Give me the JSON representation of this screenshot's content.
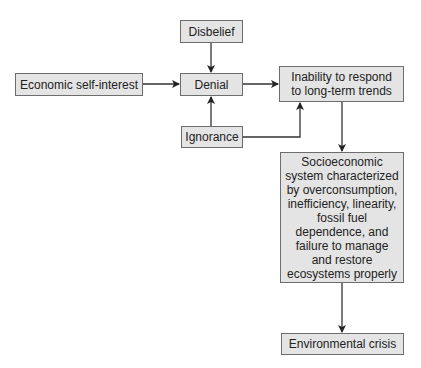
{
  "nodes": {
    "disbelief": "Disbelief",
    "economic": "Economic self-interest",
    "denial": "Denial",
    "ignorance": "Ignorance",
    "inability": "Inability to respond to long-term trends",
    "socioeconomic": "Socioeconomic system characterized by overconsumption, inefficiency, linearity, fossil fuel dependence, and failure to manage and restore ecosystems properly",
    "crisis": "Environmental crisis"
  },
  "edges": [
    {
      "from": "disbelief",
      "to": "denial"
    },
    {
      "from": "economic",
      "to": "denial"
    },
    {
      "from": "ignorance",
      "to": "denial"
    },
    {
      "from": "ignorance",
      "to": "inability"
    },
    {
      "from": "denial",
      "to": "inability"
    },
    {
      "from": "inability",
      "to": "socioeconomic"
    },
    {
      "from": "socioeconomic",
      "to": "crisis"
    }
  ]
}
